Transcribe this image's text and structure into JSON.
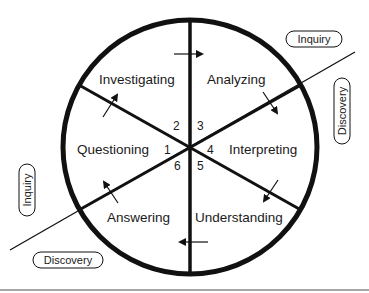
{
  "diagram": {
    "type": "cycle-wheel",
    "segments": [
      {
        "number": "1",
        "label": "Questioning"
      },
      {
        "number": "2",
        "label": "Investigating"
      },
      {
        "number": "3",
        "label": "Analyzing"
      },
      {
        "number": "4",
        "label": "Interpreting"
      },
      {
        "number": "5",
        "label": "Understanding"
      },
      {
        "number": "6",
        "label": "Answering"
      }
    ],
    "axis_tags": {
      "top_right": "Inquiry",
      "right_vertical": "Discovery",
      "left_vertical": "Inquiry",
      "bottom_left": "Discovery"
    },
    "flow_direction": "clockwise"
  }
}
